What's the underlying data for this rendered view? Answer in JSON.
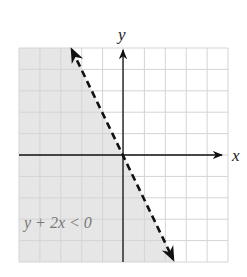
{
  "chart_data": {
    "type": "line",
    "title": "",
    "xlabel": "x",
    "ylabel": "y",
    "xlim": [
      -5,
      5
    ],
    "ylim": [
      -5,
      5
    ],
    "grid": true,
    "grid_step": 1,
    "series": [
      {
        "name": "boundary y = -2x",
        "style": "dashed",
        "x": [
          -2.5,
          2.5
        ],
        "y": [
          5,
          -5
        ],
        "arrows": "both"
      }
    ],
    "shaded_region": {
      "inequality": "y + 2x < 0",
      "side": "left/below line",
      "color": "#e8e8e8"
    },
    "annotations": [
      {
        "text": "y + 2x < 0",
        "x": -4.3,
        "y": -3.3
      }
    ]
  },
  "labels": {
    "x_axis": "x",
    "y_axis": "y",
    "inequality": "y + 2x < 0"
  },
  "colors": {
    "shade": "#e6e6e6",
    "grid": "#d4d4d4",
    "axis": "#111111",
    "line": "#111111",
    "annotation": "#777777"
  }
}
